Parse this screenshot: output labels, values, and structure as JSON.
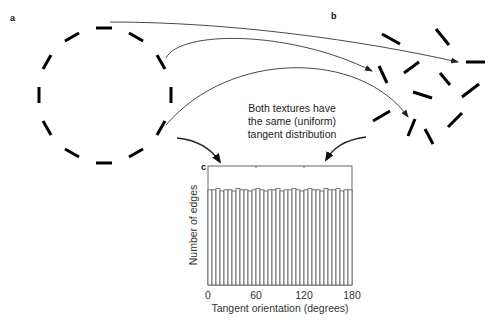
{
  "panels": {
    "a": {
      "label": "a"
    },
    "b": {
      "label": "b"
    },
    "c": {
      "label": "c"
    }
  },
  "caption": {
    "line1": "Both textures have",
    "line2": "the same (uniform)",
    "line3": "tangent distribution"
  },
  "colors": {
    "ink": "#000000",
    "bar_edge": "#555555",
    "background": "#ffffff"
  },
  "chart_data": {
    "type": "bar",
    "title": "",
    "xlabel": "Tangent orientation (degrees)",
    "ylabel": "Number of edges",
    "xticks": [
      "0",
      "60",
      "120",
      "180"
    ],
    "xlim": [
      0,
      180
    ],
    "bin_width_degrees": 5,
    "categories": [
      "0",
      "5",
      "10",
      "15",
      "20",
      "25",
      "30",
      "35",
      "40",
      "45",
      "50",
      "55",
      "60",
      "65",
      "70",
      "75",
      "80",
      "85",
      "90",
      "95",
      "100",
      "105",
      "110",
      "115",
      "120",
      "125",
      "130",
      "135",
      "140",
      "145",
      "150",
      "155",
      "160",
      "165",
      "170",
      "175"
    ],
    "values": [
      0.8,
      0.8,
      0.81,
      0.79,
      0.8,
      0.8,
      0.79,
      0.81,
      0.8,
      0.8,
      0.79,
      0.8,
      0.81,
      0.8,
      0.79,
      0.8,
      0.8,
      0.81,
      0.79,
      0.8,
      0.8,
      0.81,
      0.8,
      0.79,
      0.8,
      0.81,
      0.8,
      0.8,
      0.79,
      0.81,
      0.8,
      0.8,
      0.81,
      0.79,
      0.8,
      0.8
    ],
    "ylim": [
      0,
      1
    ],
    "yticks_visible": false,
    "grid": false,
    "legend": null,
    "note": "Uniform distribution; relative heights (no y tick values shown)"
  }
}
